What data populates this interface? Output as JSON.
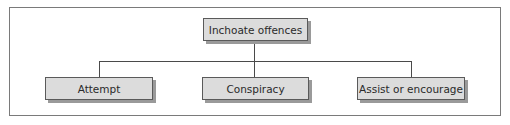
{
  "diagram": {
    "type": "hierarchy",
    "root": {
      "label": "Inchoate offences"
    },
    "children": [
      {
        "label": "Attempt"
      },
      {
        "label": "Conspiracy"
      },
      {
        "label": "Assist or encourage"
      }
    ],
    "colors": {
      "box_fill": "#dcdcdc",
      "box_border": "#5a5a5a",
      "shadow": "#9a9a9a",
      "line": "#4a4a4a",
      "frame": "#7a7a7a"
    }
  }
}
